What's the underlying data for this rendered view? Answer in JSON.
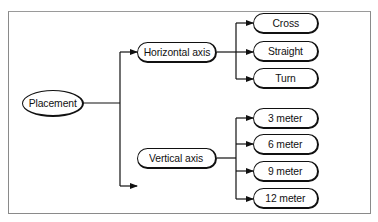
{
  "diagram": {
    "type": "tree",
    "root": {
      "label": "Placement"
    },
    "branches": [
      {
        "label": "Horizontal axis",
        "children": [
          {
            "label": "Cross"
          },
          {
            "label": "Straight"
          },
          {
            "label": "Turn"
          }
        ]
      },
      {
        "label": "Vertical axis",
        "children": [
          {
            "label": "3 meter"
          },
          {
            "label": "6 meter"
          },
          {
            "label": "9 meter"
          },
          {
            "label": "12 meter"
          }
        ]
      }
    ],
    "colors": {
      "line": "#111111",
      "frame": "#8a8a8a",
      "background": "#ffffff"
    }
  }
}
